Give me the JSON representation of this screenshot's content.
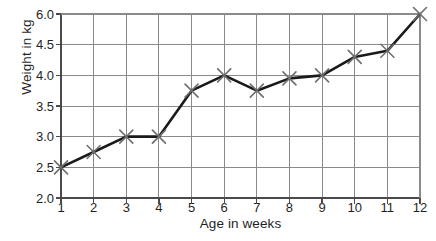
{
  "chart_data": {
    "type": "line",
    "title": "",
    "xlabel": "Age in weeks",
    "ylabel": "Weight in kg",
    "x": [
      1,
      2,
      3,
      4,
      5,
      6,
      7,
      8,
      9,
      10,
      11,
      12
    ],
    "values": [
      2.5,
      2.75,
      3.0,
      3.0,
      3.75,
      4.0,
      3.75,
      3.95,
      4.0,
      4.3,
      4.4,
      6.0
    ],
    "series": [
      {
        "name": "Weight",
        "values": [
          2.5,
          2.75,
          3.0,
          3.0,
          3.75,
          4.0,
          3.75,
          3.95,
          4.0,
          4.3,
          4.4,
          6.0
        ]
      }
    ],
    "x_tick_labels": [
      "1",
      "2",
      "3",
      "4",
      "5",
      "6",
      "7",
      "8",
      "9",
      "10",
      "11",
      "12"
    ],
    "y_tick_labels": [
      "6.0",
      "4.5",
      "4.0",
      "3.5",
      "3.0",
      "2.5",
      "2.0"
    ],
    "y_tick_values": [
      6.0,
      4.5,
      4.0,
      3.5,
      3.0,
      2.5,
      2.0
    ],
    "xlim": [
      1,
      12
    ],
    "ylim": [
      2.0,
      6.0
    ],
    "grid": true,
    "legend": "none",
    "marker": "x-cross",
    "line_color": "#1a1a1a",
    "marker_color": "#6f6f6f",
    "grid_color": "#8a8a8a",
    "axis_color": "#4a4a4a",
    "background_color": "#ffffff"
  },
  "axes": {
    "plot_left": 61,
    "plot_right": 420,
    "plot_top": 14,
    "plot_bottom": 198
  }
}
